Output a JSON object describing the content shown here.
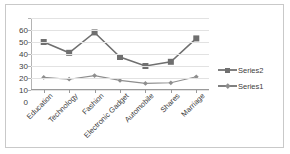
{
  "chart_data": {
    "type": "line",
    "title": "",
    "xlabel": "",
    "ylabel": "",
    "categories": [
      "Education",
      "Technology",
      "Fashion",
      "Electronic Gadget",
      "Automobile",
      "Shares",
      "Marriage"
    ],
    "series": [
      {
        "name": "Series2",
        "marker": "square",
        "color": "#6f6f6f",
        "values": [
          40,
          31,
          48,
          27.5,
          20,
          23.5,
          43
        ]
      },
      {
        "name": "Series1",
        "marker": "diamond",
        "color": "#8e8e8e",
        "values": [
          10.5,
          9,
          12,
          8,
          5.5,
          6,
          11
        ]
      }
    ],
    "ylim": [
      0,
      60
    ],
    "yticks": [
      0,
      10,
      20,
      30,
      40,
      50,
      60
    ],
    "ytick_labels": [
      "0",
      "10",
      "20",
      "30",
      "40",
      "50",
      "60"
    ],
    "grid": true,
    "legend_position": "right",
    "plot_background": "#ffffff",
    "gridline_color": "#e2e2e2",
    "border_color": "#c9c9c9"
  },
  "legend": {
    "entries": [
      {
        "label": "Series2"
      },
      {
        "label": "Series1"
      }
    ]
  }
}
